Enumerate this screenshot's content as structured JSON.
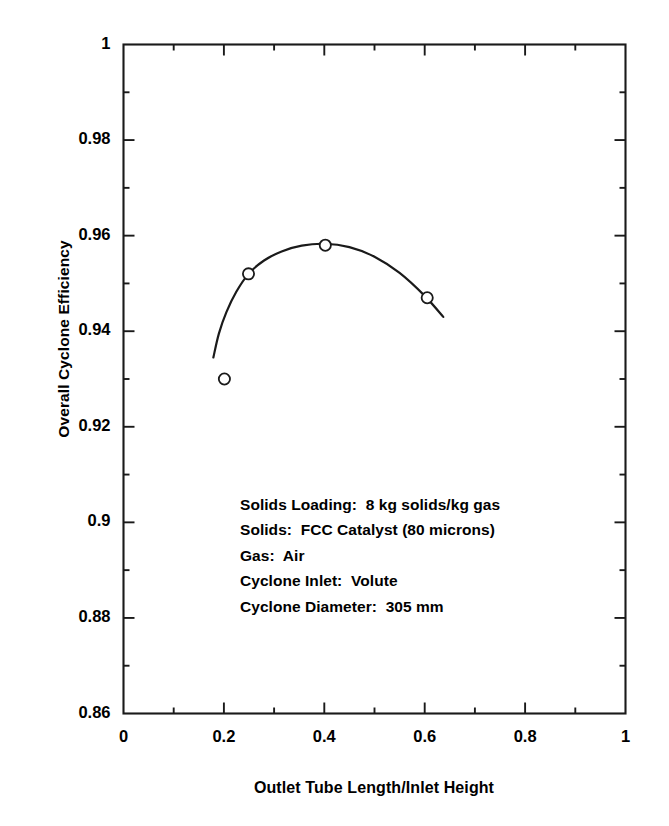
{
  "chart_data": {
    "type": "line",
    "title": "",
    "xlabel": "Outlet Tube Length/Inlet Height",
    "ylabel": "Overall Cyclone Efficiency",
    "xlim": [
      0,
      1
    ],
    "ylim": [
      0.86,
      1
    ],
    "grid": false,
    "legend": null,
    "x_major_ticks": [
      0,
      0.2,
      0.4,
      0.6,
      0.8,
      1
    ],
    "x_tick_labels": [
      "0",
      "0.2",
      "0.4",
      "0.6",
      "0.8",
      "1"
    ],
    "x_minor_ticks": [
      0.1,
      0.3,
      0.5,
      0.7,
      0.9
    ],
    "y_major_ticks": [
      0.86,
      0.88,
      0.9,
      0.92,
      0.94,
      0.96,
      0.98,
      1
    ],
    "y_tick_labels": [
      "0.86",
      "0.88",
      "0.9",
      "0.92",
      "0.94",
      "0.96",
      "0.98",
      "1"
    ],
    "y_minor_ticks": [
      0.87,
      0.89,
      0.91,
      0.93,
      0.95,
      0.97,
      0.99
    ],
    "series": [
      {
        "name": "Overall Cyclone Efficiency",
        "marker": "open-circle",
        "line": "solid",
        "x": [
          0.201,
          0.249,
          0.402,
          0.605
        ],
        "y": [
          0.93,
          0.952,
          0.958,
          0.947
        ]
      }
    ],
    "fit_curve": {
      "name": "fitted-curve",
      "x_start": 0.179,
      "x_end": 0.637,
      "x": [
        0.179,
        0.19,
        0.205,
        0.225,
        0.25,
        0.28,
        0.315,
        0.355,
        0.4,
        0.45,
        0.5,
        0.55,
        0.6,
        0.637
      ],
      "y": [
        0.9345,
        0.9395,
        0.944,
        0.9483,
        0.9521,
        0.9548,
        0.9567,
        0.9579,
        0.9583,
        0.9576,
        0.9556,
        0.9522,
        0.9474,
        0.943
      ]
    },
    "annotations": [
      "Solids Loading:  8 kg solids/kg gas",
      "Solids:  FCC Catalyst (80 microns)",
      "Gas:  Air",
      "Cyclone Inlet:  Volute",
      "Cyclone Diameter:  305 mm"
    ],
    "colors": {
      "background": "#ffffff",
      "axis": "#1a1a1a",
      "curve": "#1a1a1a",
      "marker_stroke": "#1a1a1a",
      "marker_fill": "#ffffff",
      "text": "#000000"
    }
  }
}
